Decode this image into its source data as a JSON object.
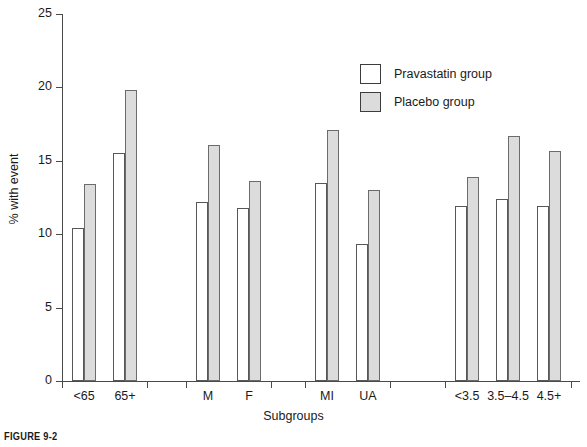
{
  "caption": "FIGURE 9-2",
  "chart_data": {
    "type": "bar",
    "title": "",
    "xlabel": "Subgroups",
    "ylabel": "% with event",
    "ylim": [
      0,
      25
    ],
    "yticks": [
      0,
      5,
      10,
      15,
      20,
      25
    ],
    "ytick_labels": [
      "0",
      "5",
      "10",
      "15",
      "20",
      "25"
    ],
    "grid": false,
    "legend_position": "top-right",
    "categories": [
      "<65",
      "65+",
      "M",
      "F",
      "MI",
      "UA",
      "<3.5",
      "3.5–4.5",
      "4.5+"
    ],
    "clusters": [
      {
        "name": "age",
        "categories": [
          "<65",
          "65+"
        ]
      },
      {
        "name": "sex",
        "categories": [
          "M",
          "F"
        ]
      },
      {
        "name": "qualifying-event",
        "categories": [
          "MI",
          "UA"
        ]
      },
      {
        "name": "ldl-cholesterol",
        "categories": [
          "<3.5",
          "3.5–4.5",
          "4.5+"
        ]
      }
    ],
    "series": [
      {
        "name": "Pravastatin group",
        "color": "#ffffff",
        "values": [
          10.4,
          15.5,
          12.2,
          11.8,
          13.5,
          9.3,
          11.9,
          12.4,
          11.9
        ]
      },
      {
        "name": "Placebo group",
        "color": "#dcdcdc",
        "values": [
          13.4,
          19.8,
          16.1,
          13.6,
          17.1,
          13.0,
          13.9,
          16.7,
          15.7
        ]
      }
    ]
  },
  "legend": {
    "items": [
      {
        "label": "Pravastatin group",
        "swatch": "prava"
      },
      {
        "label": "Placebo group",
        "swatch": "placebo"
      }
    ]
  }
}
